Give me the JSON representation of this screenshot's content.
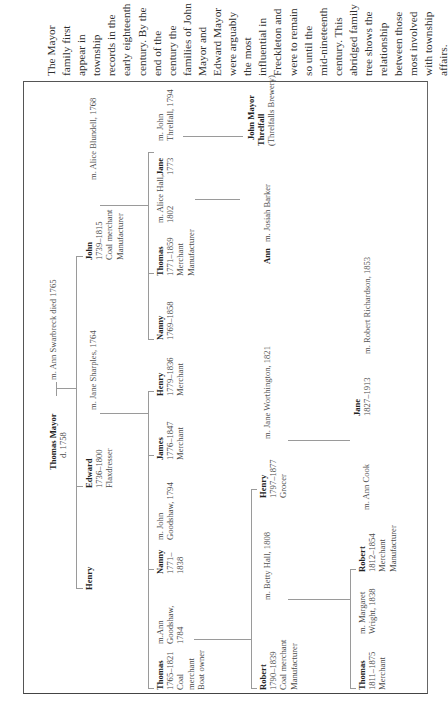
{
  "caption": {
    "lines": [
      "The Mayor",
      "family first",
      "appear in",
      "township",
      "records in the",
      "early eighteenth",
      "century. By the",
      "end of the",
      "century the",
      "families of John",
      "Mayor and",
      "Edward Mayor",
      "were arguably",
      "the most",
      "influential in",
      "Freckleton and",
      "were to remain",
      "so until the",
      "mid-nineteenth",
      "century. This",
      "abridged family",
      "tree shows the",
      "relationship",
      "between those",
      "most involved",
      "with township",
      "affairs."
    ]
  },
  "tree": {
    "gen1": {
      "head": {
        "name": "Thomas Mayor",
        "line1": "d. 1758"
      },
      "spouse": "m. Ann Swarbreck died 1765"
    },
    "gen2": {
      "henry": {
        "name": "Henry"
      },
      "edward": {
        "name": "Edward",
        "line1": "1736–1800",
        "line2": "Flaxdresser"
      },
      "edward_spouse": "m. Jane Sharples, 1764",
      "john": {
        "name": "John",
        "line1": "1739–1815",
        "line2": "Coal merchant",
        "line3": "Manufacturer"
      },
      "john_spouse": "m. Alice Blundell, 1768"
    },
    "gen3": {
      "thomas": {
        "name": "Thomas",
        "line1": "1765–1821",
        "line2": "Coal",
        "line3": "merchant",
        "line4": "Boat owner"
      },
      "thomas_spouse": {
        "line1": "m.Ann",
        "line2": "Goodshaw,",
        "line3": "1784"
      },
      "nanny_a": {
        "name": "Nanny",
        "line1": "1771–",
        "line2": "1838"
      },
      "nanny_a_spouse": {
        "line1": "m. John",
        "line2": "Goodshaw, 1794"
      },
      "james": {
        "name": "James",
        "line1": "1776–1847",
        "line2": "Merchant"
      },
      "henry": {
        "name": "Henry",
        "line1": "1779–1836",
        "line2": "Merchant"
      },
      "nanny_b": {
        "name": "Nanny",
        "line1": "1769–1858"
      },
      "thomas_b": {
        "name": "Thomas",
        "line1": "1771–1859",
        "line2": "Merchant",
        "line3": "Manufacturer"
      },
      "thomas_b_spouse": {
        "line1": "m. Alice Hall,",
        "line2": "1802"
      },
      "jane": {
        "name": "Jane",
        "line1": "1773"
      },
      "jane_spouse": {
        "line1": "m. John",
        "line2": "Threlfall, 1794"
      }
    },
    "gen4": {
      "robert": {
        "name": "Robert",
        "line1": "1790–1839",
        "line2": "Coal merchant",
        "line3": "Manufacturer"
      },
      "robert_spouse": "m. Betty Hall, 1808",
      "henry": {
        "name": "Henry",
        "line1": "1797–1877",
        "line2": "Grocer"
      },
      "henry_spouse": "m. Jane Worthington, 1821",
      "ann": {
        "name": "Ann"
      },
      "ann_spouse": "m. Josiah Barker",
      "john_mayor_threlfall": {
        "name1": "John Mayor",
        "name2": "Threlfall",
        "line1": "(Threlfalls Brewery)"
      }
    },
    "gen5": {
      "thomas": {
        "name": "Thomas",
        "line1": "1811–1875",
        "line2": "Merchant"
      },
      "thomas_spouse": {
        "line1": "m. Margaret",
        "line2": "Wright, 1838"
      },
      "robert": {
        "name": "Robert",
        "line1": "1812–1854",
        "line2": "Merchant",
        "line3": "Manufacturer"
      },
      "robert_spouse": "m. Ann Cook",
      "jane": {
        "name": "Jane",
        "line1": "1827–1913"
      },
      "jane_spouse": "m. Robert Richardson, 1853"
    }
  },
  "colors": {
    "text": "#3a3a3a",
    "names": "#222222",
    "frame": "#555555",
    "lines": "#9a9a9a",
    "background": "#ffffff"
  }
}
